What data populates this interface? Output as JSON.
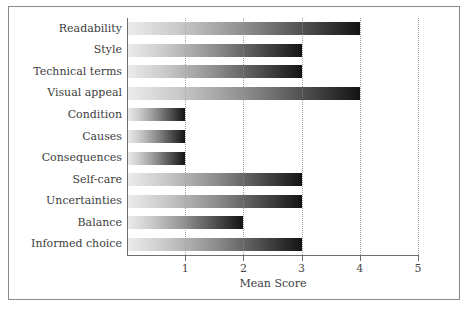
{
  "chart_data": {
    "type": "bar",
    "orientation": "horizontal",
    "title": "",
    "xlabel": "Mean Score",
    "ylabel": "",
    "categories": [
      "Readability",
      "Style",
      "Technical terms",
      "Visual appeal",
      "Condition",
      "Causes",
      "Consequences",
      "Self-care",
      "Uncertainties",
      "Balance",
      "Informed choice"
    ],
    "values": [
      4,
      3,
      3,
      4,
      1,
      1,
      1,
      3,
      3,
      2,
      3
    ],
    "xlim": [
      0,
      5
    ],
    "xticks": [
      1,
      2,
      3,
      4,
      5
    ],
    "xtick_labels": [
      "1",
      "2",
      "3",
      "4",
      "5"
    ],
    "grid": "vertical-dotted",
    "legend": "none",
    "bar_style": "horizontal-gradient-light-to-dark",
    "colors": {
      "gradient_start": "#ececec",
      "gradient_end": "#131313",
      "axis": "#6e6e6e",
      "gridline": "#9b9b9b",
      "text": "#3d3d3d",
      "frame": "#8a8a8a",
      "background": "#ffffff"
    }
  }
}
